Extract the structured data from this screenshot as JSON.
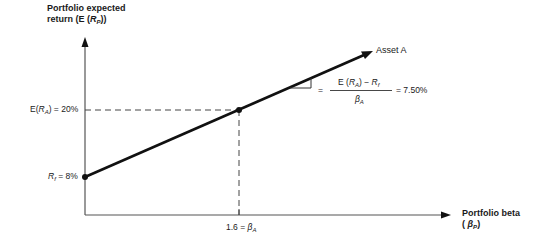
{
  "diagram": {
    "y_axis_title_line1": "Portfolio expected",
    "y_axis_title_line2": "return (E (",
    "y_axis_title_var": "R",
    "y_axis_title_sub": "P",
    "y_axis_title_end": "))",
    "x_axis_title_line1": "Portfolio beta",
    "x_axis_title_open": "(",
    "x_axis_title_var": "β",
    "x_axis_title_sub": "P",
    "x_axis_title_close": ")",
    "line_label": "Asset A",
    "point_expected_return_label": {
      "prefix": "E(",
      "var": "R",
      "sub": "A",
      "suffix": ") = 20%"
    },
    "point_rf_label": {
      "var": "R",
      "sub": "f",
      "suffix": " = 8%"
    },
    "beta_tick_label": {
      "prefix": "1.6 = ",
      "var": "β",
      "sub": "A"
    },
    "slope_formula": {
      "equals": "=",
      "numerator_prefix": "E (",
      "numerator_var": "R",
      "numerator_sub": "A",
      "numerator_mid": ") − ",
      "numerator_var2": "R",
      "numerator_sub2": "f",
      "denominator_var": "β",
      "denominator_sub": "A",
      "result": "= 7.50%"
    },
    "points": [
      {
        "name": "risk-free",
        "beta": 0,
        "return_pct": 8
      },
      {
        "name": "asset-a",
        "beta": 1.6,
        "return_pct": 20
      }
    ],
    "slope_pct": 7.5
  }
}
